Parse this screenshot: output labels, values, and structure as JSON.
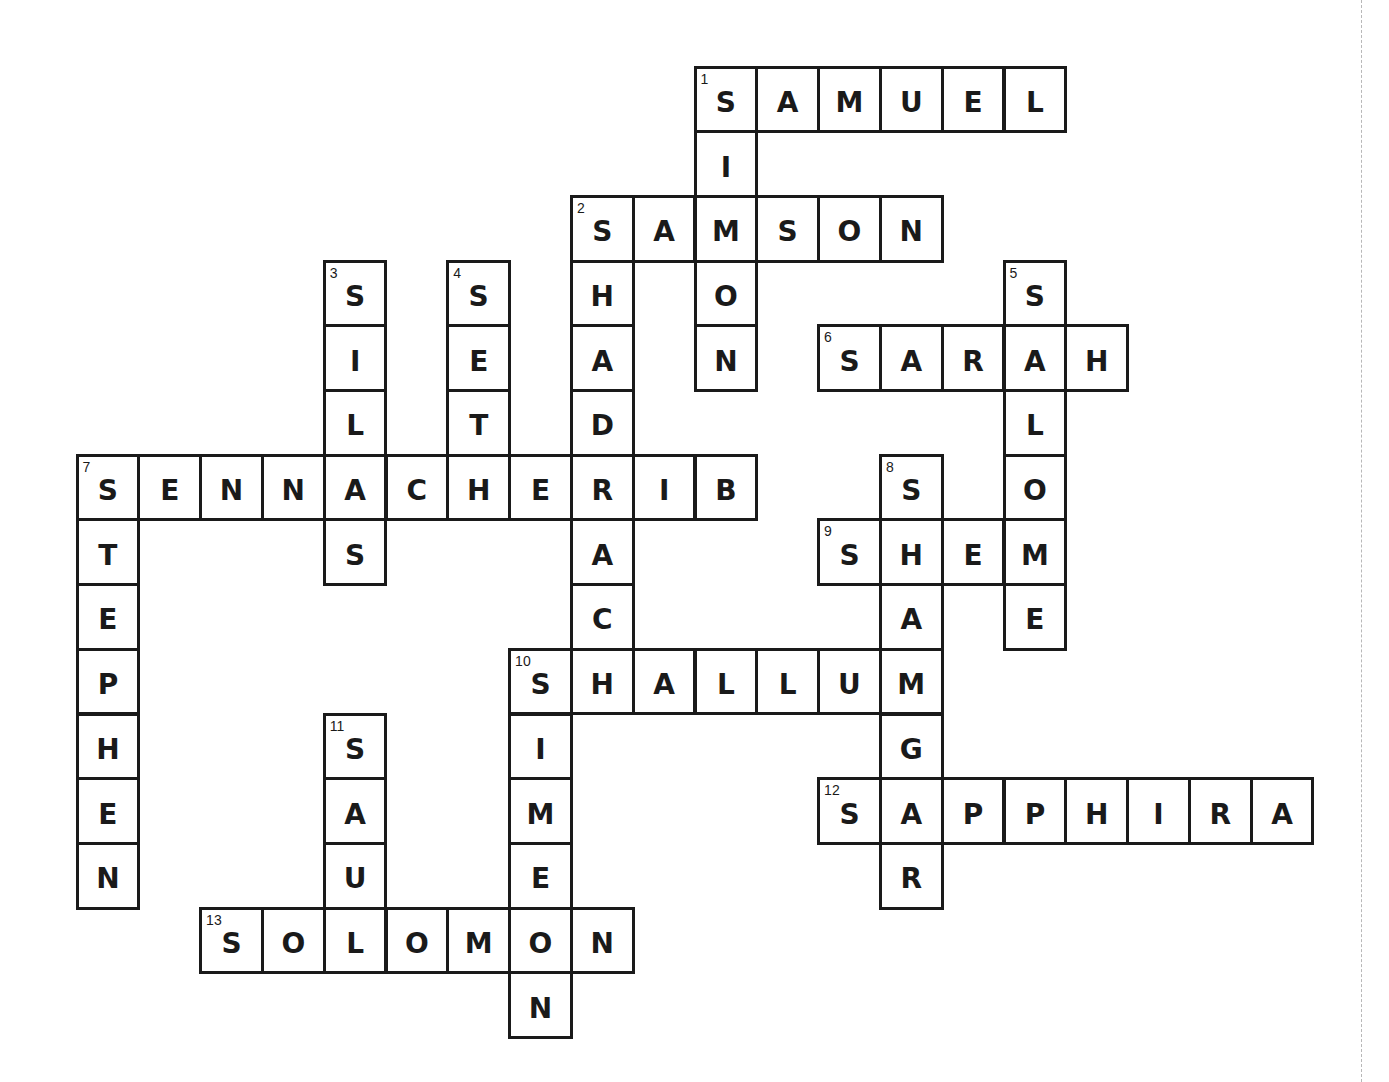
{
  "puzzle": {
    "theme": "Bible names beginning with S",
    "grid": {
      "origin_x": 77,
      "origin_y": 67,
      "cell_w": 61.8,
      "cell_h": 64.7
    },
    "colors": {
      "line": "#1a1a1a",
      "background": "#ffffff"
    },
    "words": [
      {
        "num": "1",
        "answer": "SAMUEL",
        "dir": "across",
        "row": 0,
        "col": 10
      },
      {
        "num": "1",
        "answer": "SIMON",
        "dir": "down",
        "row": 0,
        "col": 10
      },
      {
        "num": "2",
        "answer": "SAMSON",
        "dir": "across",
        "row": 2,
        "col": 8
      },
      {
        "num": "2",
        "answer": "SHADRACH",
        "dir": "down",
        "row": 2,
        "col": 8
      },
      {
        "num": "3",
        "answer": "SILAS",
        "dir": "down",
        "row": 3,
        "col": 4
      },
      {
        "num": "4",
        "answer": "SETH",
        "dir": "down",
        "row": 3,
        "col": 6
      },
      {
        "num": "5",
        "answer": "SALOME",
        "dir": "down",
        "row": 3,
        "col": 15
      },
      {
        "num": "6",
        "answer": "SARAH",
        "dir": "across",
        "row": 4,
        "col": 12
      },
      {
        "num": "7",
        "answer": "SENNACHERIB",
        "dir": "across",
        "row": 6,
        "col": 0
      },
      {
        "num": "7",
        "answer": "STEPHEN",
        "dir": "down",
        "row": 6,
        "col": 0
      },
      {
        "num": "8",
        "answer": "SHAMGAR",
        "dir": "down",
        "row": 6,
        "col": 13
      },
      {
        "num": "9",
        "answer": "SHEM",
        "dir": "across",
        "row": 7,
        "col": 12
      },
      {
        "num": "10",
        "answer": "SHALLUM",
        "dir": "across",
        "row": 9,
        "col": 7
      },
      {
        "num": "10",
        "answer": "SIMEON",
        "dir": "down",
        "row": 9,
        "col": 7
      },
      {
        "num": "11",
        "answer": "SAUL",
        "dir": "down",
        "row": 10,
        "col": 4
      },
      {
        "num": "12",
        "answer": "SAPPHIRA",
        "dir": "across",
        "row": 11,
        "col": 12
      },
      {
        "num": "13",
        "answer": "SOLOMON",
        "dir": "across",
        "row": 13,
        "col": 2
      }
    ]
  }
}
